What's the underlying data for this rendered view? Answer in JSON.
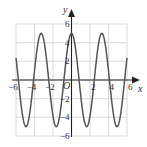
{
  "chart_data": {
    "type": "line",
    "title": "",
    "xlabel": "x",
    "ylabel": "y",
    "origin_label": "O",
    "xlim": [
      -6,
      6
    ],
    "ylim": [
      -6,
      6
    ],
    "grid": true,
    "grid_step": 2,
    "x_ticks": [
      -6,
      -4,
      -2,
      2,
      4,
      6
    ],
    "x_tick_labels": [
      "−6",
      "−4",
      "−2",
      "2",
      "4",
      "6"
    ],
    "y_ticks": [
      6,
      4,
      2,
      -2,
      -4,
      -6
    ],
    "y_tick_labels": [
      "6",
      "4",
      "2",
      "−2",
      "−4",
      "−6"
    ],
    "series": [
      {
        "name": "y ≈ 5cos(2x)",
        "amplitude": 5,
        "x": [
          -6,
          -5.5,
          -4.9,
          -4.1,
          -3.3,
          -2.45,
          -1.65,
          -0.8,
          0,
          0.8,
          1.65,
          2.45,
          3.3,
          4.1,
          4.9,
          5.5,
          6
        ],
        "values": [
          2.2,
          -1.8,
          -5,
          0,
          5,
          0,
          -5,
          0,
          5,
          0,
          -5,
          0,
          5,
          0,
          -5,
          -1.8,
          2.2
        ]
      }
    ],
    "colors": {
      "curve": "#555555",
      "axis": "#222222",
      "grid": "#d0d0d0"
    }
  }
}
